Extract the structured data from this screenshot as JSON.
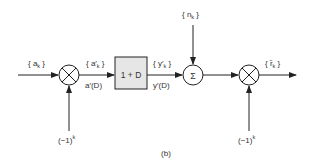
{
  "diagram": {
    "caption": "(b)",
    "colors": {
      "stroke": "#222222",
      "box_fill": "#e6e6e6",
      "text": "#333333"
    },
    "nodes": [
      {
        "id": "input",
        "label_main": "{ a",
        "label_sub": "k",
        "label_end": " }"
      },
      {
        "id": "mult1",
        "type": "multiplier",
        "symbol": "⊗",
        "control_input": "(−1)",
        "control_sup": "k"
      },
      {
        "id": "box",
        "type": "block",
        "label": "1 + D"
      },
      {
        "id": "sum",
        "type": "summer",
        "symbol": "Σ",
        "top_input_main": "{ n",
        "top_input_sub": "k",
        "top_input_end": " }"
      },
      {
        "id": "mult2",
        "type": "multiplier",
        "symbol": "⊗",
        "control_input": "(−1)",
        "control_sup": "k"
      }
    ],
    "edges": [
      {
        "from": "input",
        "to": "mult1",
        "label_top": "{a_k}"
      },
      {
        "from": "mult1",
        "to": "box",
        "label_top_main": "{ a′",
        "label_top_sub": "k",
        "label_top_end": " }",
        "label_bottom": "a′(D)"
      },
      {
        "from": "box",
        "to": "sum",
        "label_top_main": "{ y′",
        "label_top_sub": "k",
        "label_top_end": " }",
        "label_bottom": "y′(D)"
      },
      {
        "from": "sum",
        "to": "mult2"
      },
      {
        "from": "mult2",
        "to": "output",
        "label_top_main": "{ r̃",
        "label_top_sub": "k",
        "label_top_end": " }"
      }
    ]
  }
}
